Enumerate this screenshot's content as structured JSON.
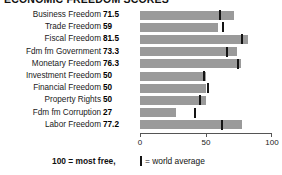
{
  "title": "ECONOMIC FREEDOM SCORES",
  "colors": {
    "bar": "#9a9a9a",
    "marker": "#141414",
    "axis": "#555555",
    "text": "#1a1a1a",
    "background": "#ffffff"
  },
  "legend": {
    "most_free_label": "100 = most free,",
    "world_average_marker": "|",
    "world_average_label": "= world average"
  },
  "axis": {
    "ticks": [
      "0",
      "50",
      "100"
    ],
    "min": 0,
    "max": 100
  },
  "chart_data": {
    "type": "bar",
    "orientation": "horizontal",
    "title": "ECONOMIC FREEDOM SCORES",
    "xlabel": "",
    "ylabel": "",
    "xlim": [
      0,
      100
    ],
    "xticks": [
      0,
      50,
      100
    ],
    "grid": false,
    "legend_position": "bottom",
    "categories": [
      "Business Freedom",
      "Trade Freedom",
      "Fiscal Freedom",
      "Fdm fm Government",
      "Monetary Freedom",
      "Investment Freedom",
      "Financial Freedom",
      "Property Rights",
      "Fdm fm Corruption",
      "Labor Freedom"
    ],
    "values": [
      71.5,
      59,
      81.5,
      73.3,
      76.3,
      50,
      50,
      50,
      27,
      77.2
    ],
    "value_labels": [
      "71.5",
      "59",
      "81.5",
      "73.3",
      "76.3",
      "50",
      "50",
      "50",
      "27",
      "77.2"
    ],
    "series": [
      {
        "name": "Country score",
        "values": [
          71.5,
          59,
          81.5,
          73.3,
          76.3,
          50,
          50,
          50,
          27,
          77.2
        ]
      },
      {
        "name": "World average",
        "marker": "vertical-line",
        "values": [
          60.0,
          62.0,
          76.5,
          65.0,
          73.5,
          48.0,
          51.0,
          44.5,
          41.0,
          61.5
        ]
      }
    ]
  }
}
